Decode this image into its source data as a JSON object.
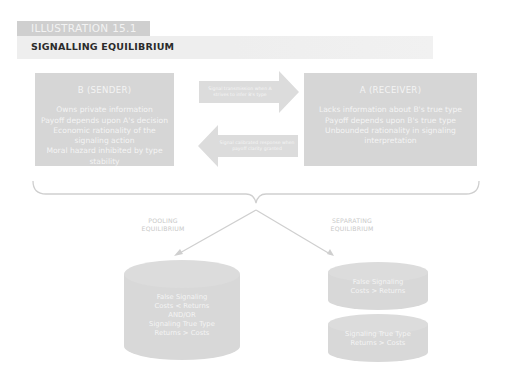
{
  "header": {
    "tag": "ILLUSTRATION 15.1",
    "title": "SIGNALLING EQUILIBRIUM"
  },
  "sender": {
    "heading": "B (SENDER)",
    "lines": [
      "Owns private information",
      "Payoff depends upon A's decision",
      "Economic rationality of the signaling action",
      "Moral hazard inhibited by type stability"
    ]
  },
  "receiver": {
    "heading": "A (RECEIVER)",
    "lines": [
      "Lacks information about B's true type",
      "Payoff depends upon B's true type",
      "Unbounded rationality in signaling interpretation"
    ]
  },
  "arrows": {
    "forward": "Signal transmission when A strives to infer B's type",
    "backward": "Signal calibrated response when payoff clarity granted"
  },
  "branches": {
    "pooling_label": [
      "POOLING",
      "EQUILIBRIUM"
    ],
    "separating_label": [
      "SEPARATING",
      "EQUILIBRIUM"
    ]
  },
  "cylinders": {
    "pooling": [
      "False Signaling",
      "Costs < Returns",
      "AND/OR",
      "Signaling True Type",
      "Returns > Costs"
    ],
    "separating_top": [
      "False Signaling",
      "Costs > Returns"
    ],
    "separating_bottom": [
      "Signaling True Type",
      "Returns > Costs"
    ]
  },
  "colors": {
    "box_fill": "#d6d6d6",
    "box_text": "#f4f4f4",
    "tag_fill": "#cfcfcf",
    "title_bar": "#eeeeee",
    "line": "#cfcfcf"
  }
}
